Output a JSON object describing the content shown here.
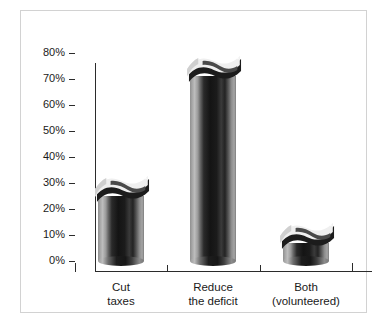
{
  "chart_data": {
    "type": "bar",
    "title": "",
    "subtitle": "",
    "xlabel": "",
    "ylabel": "",
    "categories": [
      "Cut\ntaxes",
      "Reduce\nthe deficit",
      "Both\n(volunteered)"
    ],
    "category_lines": [
      [
        "Cut",
        "taxes"
      ],
      [
        "Reduce",
        "the deficit"
      ],
      [
        "Both",
        "(volunteered)"
      ]
    ],
    "values": [
      25,
      71,
      7
    ],
    "value_labels": [
      "25%",
      "71%",
      "7%"
    ],
    "ylim": [
      0,
      80
    ],
    "ytick_values": [
      0,
      10,
      20,
      30,
      40,
      50,
      60,
      70,
      80
    ],
    "ytick_labels": [
      "0%",
      "10%",
      "20%",
      "30%",
      "40%",
      "50%",
      "60%",
      "70%",
      "80%"
    ],
    "grid": false,
    "legend": "none",
    "style": "3d-ribbon-cylinder",
    "colors": {
      "bar_light": "#bdbdbd",
      "bar_mid": "#6a6a6a",
      "bar_dark": "#141414",
      "ribbon_face": "#f2f2f2",
      "ribbon_shadow": "#1a1a1a",
      "axis": "#2b2b2b",
      "text": "#1a1a1a",
      "frame": "#d2d2d2",
      "background": "#ffffff"
    }
  },
  "figure": {
    "background": "#ffffff"
  }
}
